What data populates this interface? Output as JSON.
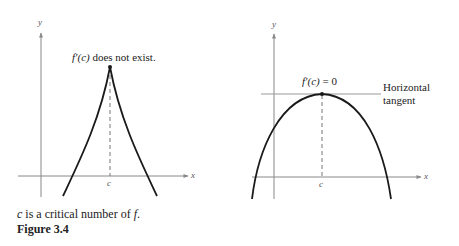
{
  "left_graph": {
    "y_axis_label": "y",
    "x_axis_label": "x",
    "point_label": "c",
    "annotation_fn": "f′(c)",
    "annotation_rest": " does not exist."
  },
  "right_graph": {
    "y_axis_label": "y",
    "x_axis_label": "x",
    "point_label": "c",
    "annotation_fn": "f′(c)",
    "annotation_rest": " = 0",
    "tangent_label_line1": "Horizontal",
    "tangent_label_line2": "tangent"
  },
  "caption": {
    "c_var": "c",
    "text_middle": " is a critical number of ",
    "f_var": "f",
    "period": ".",
    "figure_label": "Figure 3.4"
  },
  "colors": {
    "curve": "#1a1a1a",
    "axis": "#888888",
    "tangent": "#999999"
  }
}
